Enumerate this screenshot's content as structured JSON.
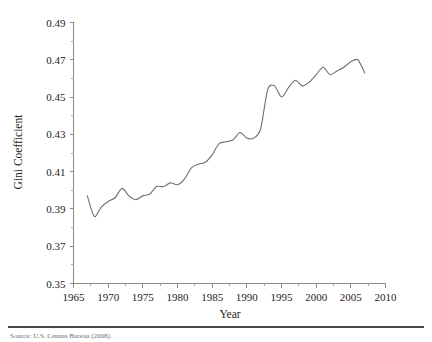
{
  "figure": {
    "background_color": "#ffffff",
    "line_color": "#6f6f6f",
    "axis_color": "#8a8a8a",
    "text_color": "#1d1d1d"
  },
  "source_note": {
    "text": "Source: U.S. Census Bureau (2008)."
  },
  "chart_data": {
    "type": "line",
    "title": "",
    "xlabel": "Year",
    "ylabel": "Gini Coefficient",
    "xlim": [
      1965,
      2010
    ],
    "ylim": [
      0.35,
      0.49
    ],
    "grid": false,
    "legend": "none",
    "x_ticks": [
      1965,
      1970,
      1975,
      1980,
      1985,
      1990,
      1995,
      2000,
      2005,
      2010
    ],
    "x_tick_labels": [
      "1965",
      "1970",
      "1975",
      "1980",
      "1985",
      "1990",
      "1995",
      "2000",
      "2005",
      "2010"
    ],
    "x_minor_tick_interval": 2.5,
    "y_ticks": [
      0.35,
      0.37,
      0.39,
      0.41,
      0.43,
      0.45,
      0.47,
      0.49
    ],
    "y_tick_labels": [
      "0.35",
      "0.37",
      "0.39",
      "0.41",
      "0.43",
      "0.45",
      "0.47",
      "0.49"
    ],
    "y_minor_tick_interval": 0.01,
    "series": [
      {
        "name": "Gini Coefficient",
        "color": "#6f6f6f",
        "x": [
          1967,
          1968,
          1969,
          1970,
          1971,
          1972,
          1973,
          1974,
          1975,
          1976,
          1977,
          1978,
          1979,
          1980,
          1981,
          1982,
          1983,
          1984,
          1985,
          1986,
          1987,
          1988,
          1989,
          1990,
          1991,
          1992,
          1993,
          1994,
          1995,
          1996,
          1997,
          1998,
          1999,
          2000,
          2001,
          2002,
          2003,
          2004,
          2005,
          2006,
          2007
        ],
        "values": [
          0.397,
          0.386,
          0.391,
          0.394,
          0.396,
          0.401,
          0.397,
          0.395,
          0.397,
          0.398,
          0.402,
          0.402,
          0.404,
          0.403,
          0.406,
          0.412,
          0.414,
          0.415,
          0.419,
          0.425,
          0.426,
          0.427,
          0.431,
          0.428,
          0.428,
          0.433,
          0.454,
          0.456,
          0.45,
          0.455,
          0.459,
          0.456,
          0.458,
          0.462,
          0.466,
          0.462,
          0.464,
          0.466,
          0.469,
          0.47,
          0.463
        ]
      }
    ]
  }
}
